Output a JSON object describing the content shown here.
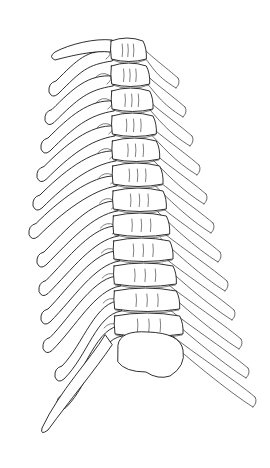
{
  "figure": {
    "subject": "Thoracic spine with ribs, line drawing",
    "style": "black ink outline on white",
    "background": "#ffffff",
    "stroke": "#1a1a1a",
    "vertebrae_count": 12,
    "left_ribs_count": 12,
    "right_ribs_count": 12
  }
}
